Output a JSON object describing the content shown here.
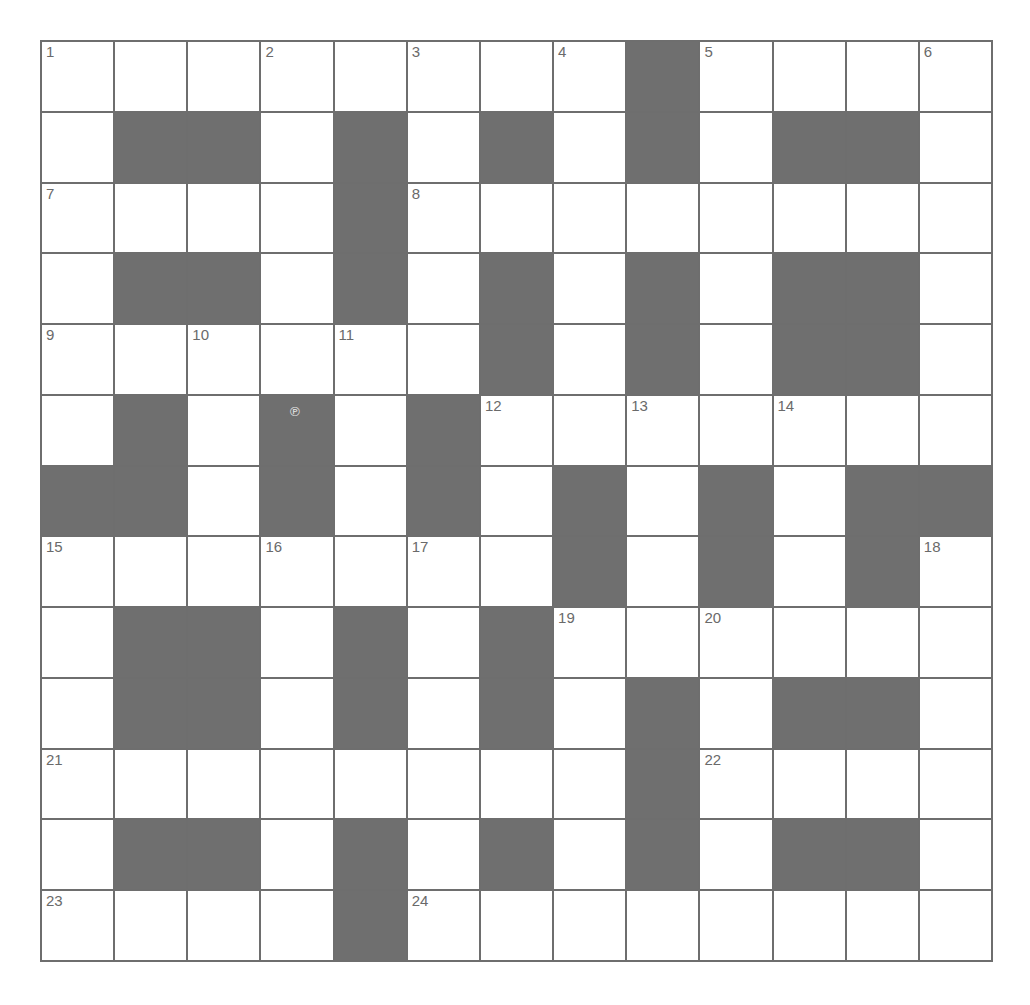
{
  "puzzle": {
    "rows": 13,
    "cols": 13,
    "colors": {
      "block": "#6f6f6f",
      "cell": "#ffffff",
      "line": "#6e6e6e",
      "number": "#6a6a6a"
    },
    "grid": [
      ".........#....",
      ".##.#.#.#.##.",
      "....#........",
      ".##.#.#.#.##.",
      "......#.#.##.",
      ".#.#.#.......",
      "##.#.#.#.#.##",
      ".......#.#.#.",
      ".##.#.#......",
      ".##.#.#.#.##.",
      "........#....",
      ".##.#.#.#.##.",
      "....#........"
    ],
    "numbers": [
      {
        "r": 0,
        "c": 0,
        "n": "1"
      },
      {
        "r": 0,
        "c": 3,
        "n": "2"
      },
      {
        "r": 0,
        "c": 5,
        "n": "3"
      },
      {
        "r": 0,
        "c": 7,
        "n": "4"
      },
      {
        "r": 0,
        "c": 9,
        "n": "5"
      },
      {
        "r": 0,
        "c": 12,
        "n": "6"
      },
      {
        "r": 2,
        "c": 0,
        "n": "7"
      },
      {
        "r": 2,
        "c": 5,
        "n": "8"
      },
      {
        "r": 4,
        "c": 0,
        "n": "9"
      },
      {
        "r": 4,
        "c": 2,
        "n": "10"
      },
      {
        "r": 4,
        "c": 4,
        "n": "11"
      },
      {
        "r": 5,
        "c": 6,
        "n": "12"
      },
      {
        "r": 5,
        "c": 8,
        "n": "13"
      },
      {
        "r": 5,
        "c": 10,
        "n": "14"
      },
      {
        "r": 7,
        "c": 0,
        "n": "15"
      },
      {
        "r": 7,
        "c": 3,
        "n": "16"
      },
      {
        "r": 7,
        "c": 5,
        "n": "17"
      },
      {
        "r": 7,
        "c": 12,
        "n": "18"
      },
      {
        "r": 8,
        "c": 7,
        "n": "19"
      },
      {
        "r": 8,
        "c": 9,
        "n": "20"
      },
      {
        "r": 10,
        "c": 0,
        "n": "21"
      },
      {
        "r": 10,
        "c": 9,
        "n": "22"
      },
      {
        "r": 12,
        "c": 0,
        "n": "23"
      },
      {
        "r": 12,
        "c": 5,
        "n": "24"
      }
    ]
  },
  "cursor": {
    "icon": "pointer-cursor-icon",
    "glyph": "℗"
  }
}
